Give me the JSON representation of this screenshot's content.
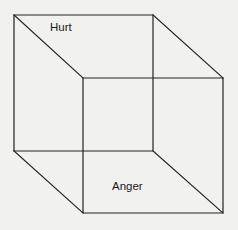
{
  "diagram": {
    "type": "necker-cube",
    "colors": {
      "background": "#f1f1f0",
      "stroke": "#222222",
      "text": "#1a1a1a"
    },
    "back_face": {
      "top_left": [
        14,
        15
      ],
      "top_right": [
        153,
        15
      ],
      "bottom_right": [
        153,
        151
      ],
      "bottom_left": [
        14,
        151
      ]
    },
    "front_face": {
      "top_left": [
        83,
        78
      ],
      "top_right": [
        223,
        78
      ],
      "bottom_right": [
        223,
        213
      ],
      "bottom_left": [
        83,
        213
      ]
    },
    "labels": [
      {
        "id": "hurt",
        "text": "Hurt",
        "x": 50,
        "y": 22
      },
      {
        "id": "anger",
        "text": "Anger",
        "x": 112,
        "y": 181
      }
    ]
  }
}
